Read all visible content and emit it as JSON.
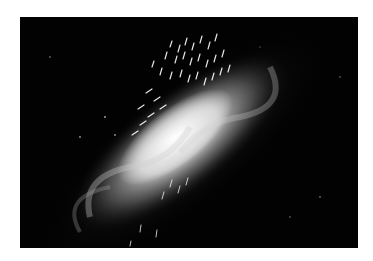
{
  "image": {
    "description": "Spiral galaxy viewed at an inclined angle on a black background, overlaid with small white arrow-like vector markers clustered near the upper part of the disk and core",
    "subject": "spiral galaxy with velocity vector arrows",
    "colors": {
      "page_background": "#ffffff",
      "frame_background": "#020202",
      "galaxy_core": "#f2f2f2",
      "galaxy_disk": "#9a9a9a",
      "arrows": "#ffffff"
    }
  }
}
